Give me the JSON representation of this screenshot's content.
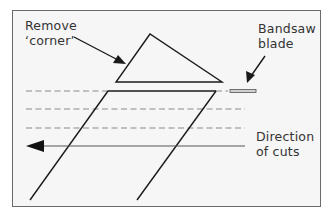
{
  "diagram": {
    "labels": {
      "remove_corner": {
        "line1": "Remove",
        "line2": "‘corner’"
      },
      "bandsaw_blade": {
        "line1": "Bandsaw",
        "line2": "blade"
      },
      "direction_of_cuts": {
        "line1": "Direction",
        "line2": "of cuts"
      }
    },
    "colors": {
      "background": "#f6f6f6",
      "frame": "#6a6a6a",
      "stroke": "#1a1a1a",
      "dashed": "#8a8a8a",
      "text": "#333333"
    },
    "shapes": {
      "corner_triangle": "triangle",
      "workpiece": "parallelogram",
      "cut_lines": "dashed-lines",
      "direction_arrow": "left-arrow",
      "blade": "rectangle"
    }
  }
}
